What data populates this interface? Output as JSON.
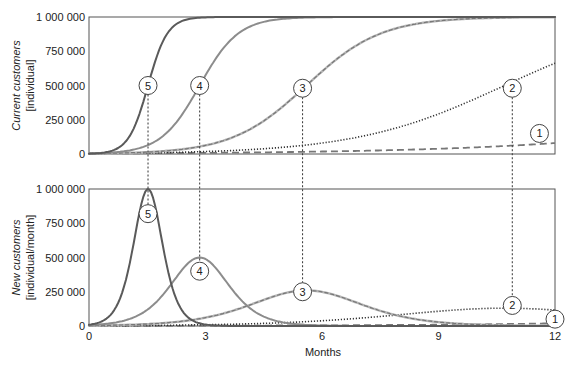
{
  "chart_data": [
    {
      "type": "line",
      "id": "top",
      "ylabel_line1": "Current customers",
      "ylabel_line2": "[individual]",
      "xlabel": "",
      "xlim": [
        0,
        12
      ],
      "ylim": [
        0,
        1000000
      ],
      "yticks": [
        0,
        250000,
        500000,
        750000,
        1000000
      ],
      "ytick_labels": [
        "0",
        "250 000",
        "500 000",
        "750 000",
        "1 000 000"
      ],
      "xticks": [],
      "grid": false,
      "callouts": [
        {
          "series": "5",
          "x": 1.52,
          "y": 500000
        },
        {
          "series": "4",
          "x": 2.85,
          "y": 500000
        },
        {
          "series": "3",
          "x": 5.5,
          "y": 480000
        },
        {
          "series": "2",
          "x": 10.9,
          "y": 480000
        },
        {
          "series": "1",
          "x": 11.6,
          "y": 150000
        }
      ]
    },
    {
      "type": "line",
      "id": "bottom",
      "ylabel_line1": "New customers",
      "ylabel_line2": "[individual/month]",
      "xlabel": "Months",
      "xlim": [
        0,
        12
      ],
      "ylim": [
        0,
        1000000
      ],
      "yticks": [
        0,
        250000,
        500000,
        750000,
        1000000
      ],
      "ytick_labels": [
        "0",
        "250 000",
        "500 000",
        "750 000",
        "1 000 000"
      ],
      "xticks": [
        0,
        3,
        6,
        9,
        12
      ],
      "xtick_labels": [
        "0",
        "3",
        "6",
        "9",
        "12"
      ],
      "grid": false,
      "callouts": [
        {
          "series": "5",
          "x": 1.52,
          "y": 820000
        },
        {
          "series": "4",
          "x": 2.85,
          "y": 400000
        },
        {
          "series": "3",
          "x": 5.5,
          "y": 250000
        },
        {
          "series": "2",
          "x": 10.9,
          "y": 150000
        },
        {
          "series": "1",
          "x": 12,
          "y": 50000
        }
      ]
    }
  ],
  "series": [
    {
      "name": "1",
      "style": "dashed",
      "color": "#777777",
      "model": {
        "market": 1000000,
        "rate": 0.26,
        "midpoint_month": 21.4
      }
    },
    {
      "name": "2",
      "style": "dotted",
      "color": "#333333",
      "model": {
        "market": 1000000,
        "rate": 0.52,
        "midpoint_month": 10.7
      }
    },
    {
      "name": "3",
      "style": "dashed-on-solid",
      "color": "#8a8a8a",
      "model": {
        "market": 1000000,
        "rate": 1.04,
        "midpoint_month": 5.6
      }
    },
    {
      "name": "4",
      "style": "solid",
      "color": "#8c8c8c",
      "model": {
        "market": 1000000,
        "rate": 2.0,
        "midpoint_month": 2.85
      }
    },
    {
      "name": "5",
      "style": "solid",
      "color": "#5a5a5a",
      "model": {
        "market": 1000000,
        "rate": 4.0,
        "midpoint_month": 1.52
      }
    }
  ],
  "sampled_values": {
    "months": [
      0,
      1,
      2,
      3,
      4,
      5,
      6,
      7,
      8,
      9,
      10,
      11,
      12
    ],
    "current_customers": {
      "1": [
        4000,
        5200,
        6700,
        8700,
        11200,
        14500,
        18700,
        24100,
        30900,
        39600,
        50400,
        63900,
        80400
      ],
      "2": [
        3800,
        6400,
        10600,
        17900,
        29900,
        49700,
        81600,
        130900,
        203600,
        302900,
        425200,
        560700,
        667500
      ],
      "3": [
        3000,
        8400,
        23000,
        60800,
        159300,
        348800,
        602600,
        810500,
        923900,
        967900,
        989000,
        996100,
        998700
      ],
      "4": [
        3300,
        24500,
        154300,
        574400,
        908500,
        986900,
        998300,
        999800,
        1000000,
        1000000,
        1000000,
        1000000,
        1000000
      ],
      "5": [
        2300,
        111000,
        872500,
        999000,
        1000000,
        1000000,
        1000000,
        1000000,
        1000000,
        1000000,
        1000000,
        1000000,
        1000000
      ]
    },
    "new_customers_per_month": {
      "1": [
        1000,
        1300,
        1700,
        2200,
        2900,
        3700,
        4800,
        6100,
        7800,
        9900,
        12400,
        15600,
        19200
      ],
      "2": [
        2000,
        3300,
        5500,
        9100,
        15100,
        24600,
        39000,
        59200,
        84300,
        109800,
        127100,
        128100,
        115400
      ],
      "3": [
        3100,
        8600,
        23400,
        59400,
        139400,
        236100,
        250000,
        160000,
        73300,
        32300,
        11300,
        4000,
        1400
      ],
      "4": [
        6600,
        47800,
        261000,
        489100,
        166200,
        25800,
        3400,
        400,
        0,
        0,
        0,
        0,
        0
      ],
      "5": [
        9300,
        394500,
        445000,
        4000,
        0,
        0,
        0,
        0,
        0,
        0,
        0,
        0,
        0
      ]
    }
  }
}
